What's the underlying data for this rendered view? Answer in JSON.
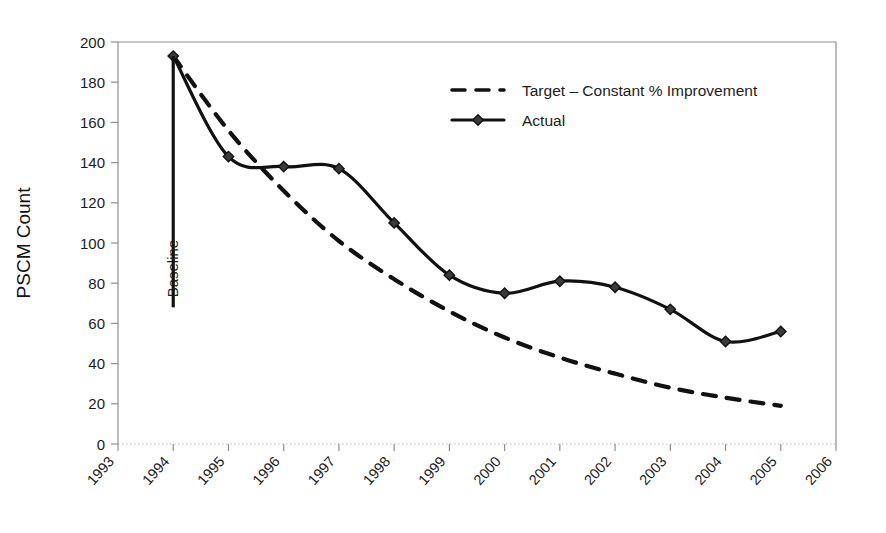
{
  "chart_data": {
    "type": "line",
    "title": "",
    "xlabel": "",
    "ylabel": "PSCM Count",
    "xlim": [
      1993,
      2006
    ],
    "ylim": [
      0,
      200
    ],
    "ytick_step": 20,
    "grid": false,
    "legend_position": "upper-center-right",
    "categories": [
      1993,
      1994,
      1995,
      1996,
      1997,
      1998,
      1999,
      2000,
      2001,
      2002,
      2003,
      2004,
      2005,
      2006
    ],
    "xtick_labels": [
      "1993",
      "1994",
      "1995",
      "1996",
      "1997",
      "1998",
      "1999",
      "2000",
      "2001",
      "2002",
      "2003",
      "2004",
      "2005",
      "2006"
    ],
    "ytick_labels": [
      "0",
      "20",
      "40",
      "60",
      "80",
      "100",
      "120",
      "140",
      "160",
      "180",
      "200"
    ],
    "ytick_values": [
      0,
      20,
      40,
      60,
      80,
      100,
      120,
      140,
      160,
      180,
      200
    ],
    "series": [
      {
        "name": "Target – Constant % Improvement",
        "style": "dashed",
        "marker": "none",
        "color": "#111111",
        "x": [
          1994,
          1995,
          1996,
          1997,
          1998,
          1999,
          2000,
          2001,
          2002,
          2003,
          2004,
          2005
        ],
        "values": [
          193,
          156,
          126,
          101,
          82,
          66,
          53,
          43,
          35,
          28,
          23,
          19
        ]
      },
      {
        "name": "Actual",
        "style": "solid",
        "marker": "diamond",
        "color": "#111111",
        "x": [
          1994,
          1995,
          1996,
          1997,
          1998,
          1999,
          2000,
          2001,
          2002,
          2003,
          2004,
          2005
        ],
        "values": [
          193,
          143,
          138,
          137,
          110,
          84,
          75,
          81,
          78,
          67,
          51,
          56
        ]
      }
    ],
    "annotations": [
      {
        "text": "Baseline",
        "kind": "vertical-line-with-label",
        "x": 1994,
        "y_top": 193,
        "y_bottom": 68,
        "rotation": -90
      }
    ]
  },
  "legend": {
    "entries": [
      {
        "label": "Target – Constant % Improvement",
        "style": "dashed",
        "marker": "none"
      },
      {
        "label": "Actual",
        "style": "solid",
        "marker": "diamond"
      }
    ]
  },
  "colors": {
    "ink": "#111111",
    "axis": "#8f8f8f",
    "background": "#ffffff"
  }
}
